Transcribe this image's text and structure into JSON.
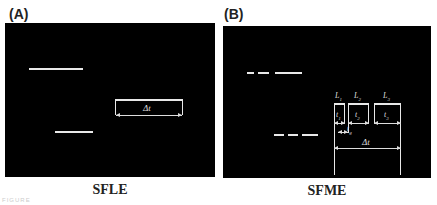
{
  "panels": [
    {
      "label": "(A)",
      "caption": "SFLE",
      "annotations": {
        "delta_t": "Δt"
      }
    },
    {
      "label": "(B)",
      "caption": "SFME",
      "annotations": {
        "L1": "L",
        "L1_sub": "1",
        "L2": "L",
        "L2_sub": "2",
        "L3": "L",
        "L3_sub": "3",
        "t1": "t",
        "t1_sub": "1",
        "t2": "t",
        "t2_sub": "2",
        "t3": "t",
        "t3_sub": "3",
        "tg": "t",
        "tg_sub": "g",
        "delta_t": "Δt"
      }
    }
  ],
  "footer": {
    "note": "FIGURE"
  },
  "colors": {
    "background": "#000000",
    "line": "#e8e8e8"
  }
}
